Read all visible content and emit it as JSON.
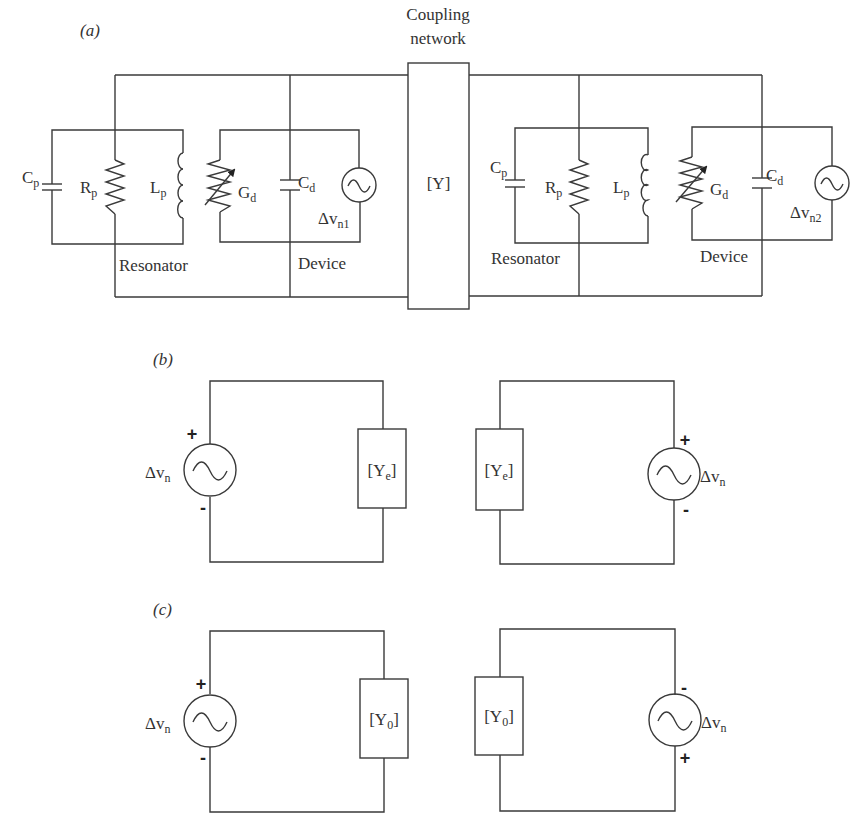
{
  "figure": {
    "panels": [
      {
        "id": "a",
        "label": "(a)",
        "coupling_network": {
          "title_line1": "Coupling",
          "title_line2": "network",
          "matrix_label": "[Y]"
        },
        "left_oscillator": {
          "resonator": {
            "label": "Resonator",
            "capacitor": {
              "base": "C",
              "sub": "p"
            },
            "resistor": {
              "base": "R",
              "sub": "p"
            },
            "inductor": {
              "base": "L",
              "sub": "p"
            }
          },
          "device": {
            "label": "Device",
            "conductance": {
              "base": "G",
              "sub": "d"
            },
            "capacitor": {
              "base": "C",
              "sub": "d"
            },
            "noise_source": {
              "base": "Δv",
              "sub": "n1"
            }
          }
        },
        "right_oscillator": {
          "resonator": {
            "label": "Resonator",
            "capacitor": {
              "base": "C",
              "sub": "p"
            },
            "resistor": {
              "base": "R",
              "sub": "p"
            },
            "inductor": {
              "base": "L",
              "sub": "p"
            }
          },
          "device": {
            "label": "Device",
            "conductance": {
              "base": "G",
              "sub": "d"
            },
            "capacitor": {
              "base": "C",
              "sub": "d"
            },
            "noise_source": {
              "base": "Δv",
              "sub": "n2"
            }
          }
        }
      },
      {
        "id": "b",
        "label": "(b)",
        "left_circuit": {
          "source": {
            "base": "Δv",
            "sub": "n",
            "top_sign": "+",
            "bottom_sign": "-"
          },
          "admittance": {
            "open": "[Y",
            "sub": "e",
            "close": "]"
          }
        },
        "right_circuit": {
          "source": {
            "base": "Δv",
            "sub": "n",
            "top_sign": "+",
            "bottom_sign": "-"
          },
          "admittance": {
            "open": "[Y",
            "sub": "e",
            "close": "]"
          }
        }
      },
      {
        "id": "c",
        "label": "(c)",
        "left_circuit": {
          "source": {
            "base": "Δv",
            "sub": "n",
            "top_sign": "+",
            "bottom_sign": "-"
          },
          "admittance": {
            "open": "[Y",
            "sub": "0",
            "close": "]"
          }
        },
        "right_circuit": {
          "source": {
            "base": "Δv",
            "sub": "n",
            "top_sign": "-",
            "bottom_sign": "+"
          },
          "admittance": {
            "open": "[Y",
            "sub": "0",
            "close": "]"
          }
        }
      }
    ],
    "colors": {
      "line": "#3a3a3a",
      "text": "#333333",
      "background": "#ffffff"
    }
  }
}
